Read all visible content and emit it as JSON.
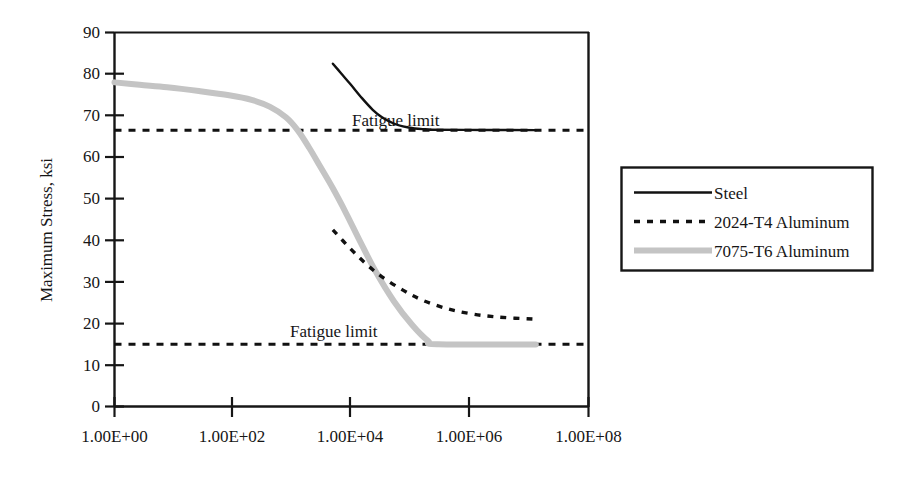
{
  "chart_data": {
    "type": "line",
    "title": "",
    "xlabel": "",
    "ylabel": "Maximum Stress, ksi",
    "xscale": "log",
    "x_tick_labels": [
      "1.00E+00",
      "1.00E+02",
      "1.00E+04",
      "1.00E+06",
      "1.00E+08"
    ],
    "x_tick_values": [
      1,
      100,
      10000,
      1000000,
      100000000
    ],
    "xlim": [
      1,
      1000000000
    ],
    "y_tick_labels": [
      "0",
      "10",
      "20",
      "30",
      "40",
      "50",
      "60",
      "70",
      "80",
      "90"
    ],
    "y_tick_values": [
      0,
      10,
      20,
      30,
      40,
      50,
      60,
      70,
      80,
      90
    ],
    "ylim": [
      0,
      90
    ],
    "grid": false,
    "legend_position": "right-outside",
    "annotations": [
      {
        "text": "Fatigue limit",
        "x": 1200000,
        "y": 69,
        "note": "upper, above steel fatigue limit line"
      },
      {
        "text": "Fatigue limit",
        "x": 13000,
        "y": 19,
        "note": "lower, above aluminum reference line"
      }
    ],
    "reference_lines": [
      {
        "name": "steel-fatigue-limit",
        "y": 66.5,
        "style": "dashed",
        "color": "#111111"
      },
      {
        "name": "aluminum-fatigue-limit",
        "y": 15,
        "style": "dashed",
        "color": "#111111"
      }
    ],
    "series": [
      {
        "name": "Steel",
        "style": "solid",
        "color": "#111111",
        "width": 2,
        "points": [
          [
            1000000,
            66.6
          ],
          [
            800000,
            66.7
          ],
          [
            500000,
            66.9
          ],
          [
            300000,
            67.4
          ],
          [
            200000,
            68.1
          ],
          [
            120000,
            69.6
          ],
          [
            80000,
            71.4
          ],
          [
            50000,
            74.2
          ],
          [
            30000,
            77.6
          ],
          [
            20000,
            80.2
          ],
          [
            14000,
            82.5
          ]
        ],
        "points_right_tail": [
          [
            1000000,
            66.6
          ],
          [
            10000000,
            66.55
          ],
          [
            100000000,
            66.5
          ]
        ]
      },
      {
        "name": "2024-T4 Aluminum",
        "style": "dotted",
        "color": "#111111",
        "width": 3,
        "points": [
          [
            14000,
            42.5
          ],
          [
            30000,
            38.0
          ],
          [
            60000,
            34.3
          ],
          [
            120000,
            31.2
          ],
          [
            300000,
            28.0
          ],
          [
            700000,
            25.6
          ],
          [
            2000000,
            23.6
          ],
          [
            6000000,
            22.3
          ],
          [
            20000000,
            21.5
          ],
          [
            100000000,
            21.0
          ]
        ]
      },
      {
        "name": "7075-T6 Aluminum",
        "style": "solid",
        "color": "#c4c4c4",
        "width": 6,
        "points": [
          [
            1,
            78.0
          ],
          [
            3,
            77.4
          ],
          [
            10,
            76.8
          ],
          [
            40,
            75.9
          ],
          [
            150,
            74.9
          ],
          [
            400,
            73.8
          ],
          [
            900,
            72.1
          ],
          [
            1800,
            69.6
          ],
          [
            3000,
            66.5
          ],
          [
            5000,
            62.2
          ],
          [
            8000,
            57.8
          ],
          [
            14000,
            52.5
          ],
          [
            25000,
            46.5
          ],
          [
            45000,
            40.0
          ],
          [
            90000,
            32.6
          ],
          [
            200000,
            25.4
          ],
          [
            450000,
            19.6
          ],
          [
            900000,
            15.8
          ],
          [
            1400000,
            15.0
          ],
          [
            100000000,
            14.9
          ]
        ]
      }
    ]
  },
  "axis": {
    "y_label": "Maximum Stress, ksi"
  },
  "legend": {
    "items": [
      {
        "label": "Steel",
        "swatch": "solid-line-black"
      },
      {
        "label": "2024-T4 Aluminum",
        "swatch": "dotted-line-black"
      },
      {
        "label": "7075-T6 Aluminum",
        "swatch": "solid-line-gray"
      }
    ]
  },
  "colors": {
    "axis": "#161616",
    "steel": "#111111",
    "aluminum_2024": "#111111",
    "aluminum_7075": "#c4c4c4",
    "background": "#ffffff"
  }
}
